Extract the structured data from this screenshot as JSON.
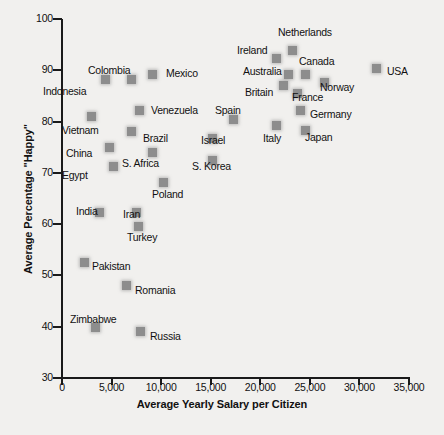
{
  "chart_data": {
    "type": "scatter",
    "title": "",
    "xlabel": "Average Yearly Salary per Citizen",
    "ylabel": "Average Percentage \"Happy\"",
    "xlim": [
      0,
      35000
    ],
    "ylim": [
      30,
      100
    ],
    "xticks": [
      0,
      5000,
      10000,
      15000,
      20000,
      25000,
      30000,
      35000
    ],
    "xtick_labels": [
      "0",
      "5,000",
      "10,000",
      "15,000",
      "20,000",
      "25,000",
      "30,000",
      "35,000"
    ],
    "yticks": [
      30,
      40,
      50,
      60,
      70,
      80,
      90,
      100
    ],
    "ytick_labels": [
      "30",
      "40",
      "50",
      "60",
      "70",
      "80",
      "90",
      "100"
    ],
    "grid": false,
    "legend": "none",
    "marker_color": "#8d8d8d",
    "background_color": "#f1f0ee",
    "points": [
      {
        "label": "Indonesia",
        "x": 4300,
        "y": 88,
        "px": 105,
        "py": 79,
        "lx": 43,
        "ly": 85
      },
      {
        "label": "Colombia",
        "x": 6950,
        "y": 88,
        "px": 131,
        "py": 79,
        "lx": 88,
        "ly": 64
      },
      {
        "label": "Mexico",
        "x": 9050,
        "y": 89,
        "px": 152,
        "py": 74,
        "lx": 166,
        "ly": 67
      },
      {
        "label": "Venezuela",
        "x": 7800,
        "y": 82,
        "px": 139,
        "py": 110,
        "lx": 151,
        "ly": 104
      },
      {
        "label": "Vietnam",
        "x": 2950,
        "y": 80,
        "px": 91,
        "py": 116,
        "lx": 62,
        "ly": 124
      },
      {
        "label": "Brazil",
        "x": 6950,
        "y": 78,
        "px": 131,
        "py": 131,
        "lx": 143,
        "ly": 132
      },
      {
        "label": "China",
        "x": 4700,
        "y": 75,
        "px": 109,
        "py": 147,
        "lx": 66,
        "ly": 147
      },
      {
        "label": "S. Africa",
        "x": 9050,
        "y": 74,
        "px": 152,
        "py": 152,
        "lx": 122,
        "ly": 157
      },
      {
        "label": "Egypt",
        "x": 5150,
        "y": 71,
        "px": 113,
        "py": 166,
        "lx": 62,
        "ly": 169
      },
      {
        "label": "Poland",
        "x": 10200,
        "y": 68,
        "px": 163,
        "py": 182,
        "lx": 152,
        "ly": 188
      },
      {
        "label": "India",
        "x": 3750,
        "y": 62,
        "px": 99,
        "py": 212,
        "lx": 76,
        "ly": 205
      },
      {
        "label": "Iran",
        "x": 7500,
        "y": 62,
        "px": 136,
        "py": 212,
        "lx": 123,
        "ly": 208
      },
      {
        "label": "Turkey",
        "x": 7700,
        "y": 59,
        "px": 138,
        "py": 226,
        "lx": 127,
        "ly": 231
      },
      {
        "label": "Pakistan",
        "x": 2300,
        "y": 53,
        "px": 84,
        "py": 262,
        "lx": 92,
        "ly": 260
      },
      {
        "label": "Romania",
        "x": 6500,
        "y": 48,
        "px": 126,
        "py": 285,
        "lx": 135,
        "ly": 284
      },
      {
        "label": "Zimbabwe",
        "x": 3350,
        "y": 40,
        "px": 95,
        "py": 327,
        "lx": 70,
        "ly": 313
      },
      {
        "label": "Russia",
        "x": 7900,
        "y": 39,
        "px": 140,
        "py": 331,
        "lx": 150,
        "ly": 330
      },
      {
        "label": "S. Korea",
        "x": 15200,
        "y": 72,
        "px": 212,
        "py": 160,
        "lx": 192,
        "ly": 160
      },
      {
        "label": "Israel",
        "x": 15200,
        "y": 76,
        "px": 212,
        "py": 138,
        "lx": 201,
        "ly": 134
      },
      {
        "label": "Spain",
        "x": 17300,
        "y": 80,
        "px": 233,
        "py": 119,
        "lx": 215,
        "ly": 104
      },
      {
        "label": "Italy",
        "x": 21600,
        "y": 78,
        "px": 276,
        "py": 125,
        "lx": 263,
        "ly": 132
      },
      {
        "label": "Japan",
        "x": 24500,
        "y": 77,
        "px": 305,
        "py": 130,
        "lx": 305,
        "ly": 131
      },
      {
        "label": "Germany",
        "x": 24000,
        "y": 81,
        "px": 300,
        "py": 110,
        "lx": 310,
        "ly": 108
      },
      {
        "label": "France",
        "x": 23700,
        "y": 85,
        "px": 297,
        "py": 93,
        "lx": 292,
        "ly": 91
      },
      {
        "label": "Britain",
        "x": 22300,
        "y": 87,
        "px": 283,
        "py": 85,
        "lx": 245,
        "ly": 86
      },
      {
        "label": "Norway",
        "x": 26500,
        "y": 88,
        "px": 324,
        "py": 82,
        "lx": 320,
        "ly": 81
      },
      {
        "label": "Australia",
        "x": 22800,
        "y": 89,
        "px": 288,
        "py": 74,
        "lx": 243,
        "ly": 65
      },
      {
        "label": "Canada",
        "x": 24500,
        "y": 89,
        "px": 305,
        "py": 74,
        "lx": 299,
        "ly": 55
      },
      {
        "label": "Ireland",
        "x": 21600,
        "y": 92,
        "px": 276,
        "py": 58,
        "lx": 237,
        "ly": 44
      },
      {
        "label": "Netherlands",
        "x": 23200,
        "y": 93,
        "px": 292,
        "py": 50,
        "lx": 278,
        "ly": 26
      },
      {
        "label": "USA",
        "x": 31700,
        "y": 90,
        "px": 376,
        "py": 68,
        "lx": 387,
        "ly": 65
      }
    ]
  }
}
